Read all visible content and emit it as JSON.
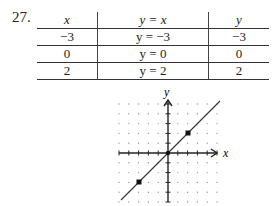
{
  "exercise": {
    "number": "27.",
    "table": {
      "headers": [
        "x",
        "y = x",
        "y"
      ],
      "rows": [
        [
          "−3",
          "y = −3",
          "−3"
        ],
        [
          "0",
          "y =  0",
          "0"
        ],
        [
          "2",
          "y = 2",
          "2"
        ]
      ]
    },
    "graph": {
      "x_label": "x",
      "y_label": "y",
      "points": [
        [
          -3,
          -3
        ],
        [
          2,
          2
        ]
      ],
      "line": "y = x",
      "grid_range": [
        -5,
        5
      ]
    }
  }
}
